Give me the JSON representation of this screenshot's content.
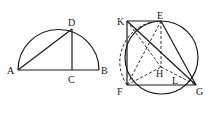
{
  "figures": [
    {
      "id": "semicircle",
      "points": {
        "A": {
          "label": "A",
          "x": 18,
          "y": 70
        },
        "B": {
          "label": "B",
          "x": 99,
          "y": 70
        },
        "C": {
          "label": "C",
          "x": 72,
          "y": 70
        },
        "D": {
          "label": "D",
          "x": 72,
          "y": 29
        }
      },
      "segments": [
        "AB",
        "AD",
        "DC"
      ],
      "arc": "semicircle on AB"
    },
    {
      "id": "circle-construction",
      "points": {
        "K": {
          "label": "K",
          "x": 127,
          "y": 21
        },
        "E": {
          "label": "E",
          "x": 161,
          "y": 21
        },
        "F": {
          "label": "F",
          "x": 127,
          "y": 85
        },
        "G": {
          "label": "G",
          "x": 196,
          "y": 85
        },
        "H": {
          "label": "H",
          "x": 161,
          "y": 67
        },
        "L": {
          "label": "L",
          "x": 174,
          "y": 78
        }
      },
      "solid_segments": [
        "KE",
        "KF",
        "FG",
        "KG",
        "EG"
      ],
      "dashed_segments": [
        "EH",
        "FE",
        "FH",
        "HG",
        "KH",
        "HL"
      ],
      "circle": "circle through E, F, G",
      "dashed_arc": "arc from F through K region to E"
    }
  ],
  "colors": {
    "stroke": "#1a1a1a",
    "background": "#ffffff"
  }
}
